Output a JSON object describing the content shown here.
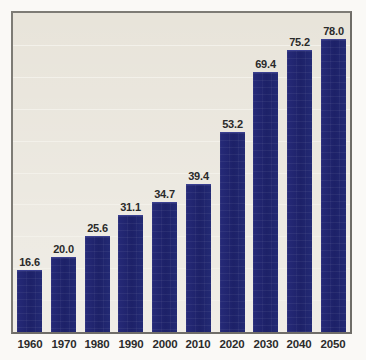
{
  "chart_data": {
    "type": "bar",
    "title": "",
    "subtitle": "",
    "xlabel": "",
    "ylabel": "",
    "categories": [
      "1960",
      "1970",
      "1980",
      "1990",
      "2000",
      "2010",
      "2020",
      "2030",
      "2040",
      "2050"
    ],
    "values": [
      16.6,
      20.0,
      25.6,
      31.1,
      34.7,
      39.4,
      53.2,
      69.4,
      75.2,
      78.0
    ],
    "value_labels": [
      "16.6",
      "20.0",
      "25.6",
      "31.1",
      "34.7",
      "39.4",
      "53.2",
      "69.4",
      "75.2",
      "78.0"
    ],
    "tick_labels": [
      "1960",
      "1970",
      "1980",
      "1990",
      "2000",
      "2010",
      "2020",
      "2030",
      "2040",
      "2050"
    ],
    "ylim": [
      0,
      85
    ],
    "grid": true,
    "gridline_count": 9,
    "legend": null,
    "legend_position": "none",
    "annotations": [],
    "colors": {
      "bar": "#1f2470",
      "bar_highlight": "#3a3f90",
      "plot_background": "#e8e4da",
      "figure_background": "#faf9f6",
      "frame_border": "#6f6d68",
      "gridline": "#f3f1ea",
      "label_text": "#2a2a2a"
    }
  }
}
